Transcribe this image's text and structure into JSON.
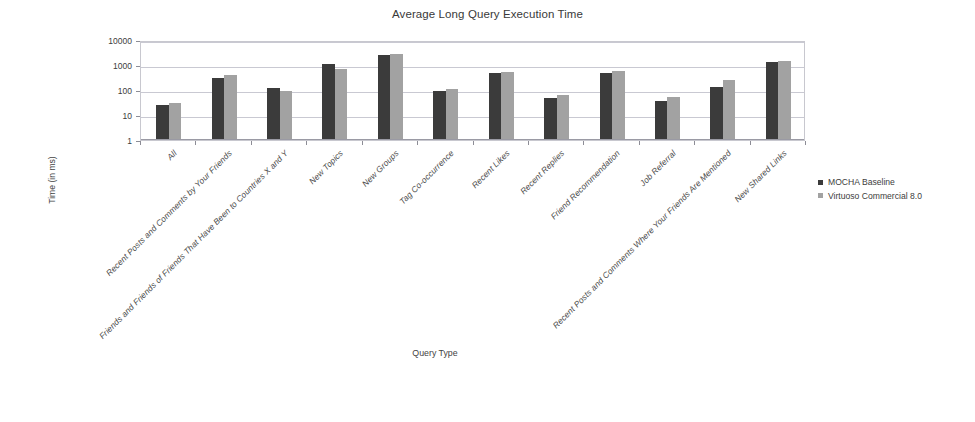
{
  "chart_data": {
    "type": "bar",
    "title": "Average Long Query Execution Time",
    "xlabel": "Query Type",
    "ylabel": "Time (in ms)",
    "yscale": "log",
    "ylim": [
      1,
      10000
    ],
    "yticks": [
      "1",
      "10",
      "100",
      "1000",
      "10000"
    ],
    "grid": true,
    "legend_position": "right",
    "categories": [
      "All",
      "Recent Posts and Comments by Your Friends",
      "Friends and Friends of Friends That Have Been to Countries X and Y",
      "New Topics",
      "New Groups",
      "Tag Co-occurrence",
      "Recent Likes",
      "Recent Replies",
      "Friend Recommendation",
      "Job Referral",
      "Recent Posts and Comments Where Your Friends Are Mentioned",
      "New Shared Links"
    ],
    "series": [
      {
        "name": "MOCHA Baseline",
        "color": "#3b3b3b",
        "values": [
          26,
          300,
          120,
          1100,
          2500,
          95,
          490,
          50,
          490,
          35,
          135,
          1300
        ]
      },
      {
        "name": "Virtuoso Commercial 8.0",
        "color": "#a2a2a2",
        "values": [
          30,
          390,
          90,
          720,
          2700,
          105,
          520,
          65,
          570,
          55,
          250,
          1450
        ]
      }
    ]
  },
  "legend": {
    "items": [
      {
        "label": "MOCHA Baseline"
      },
      {
        "label": "Virtuoso Commercial 8.0"
      }
    ]
  }
}
